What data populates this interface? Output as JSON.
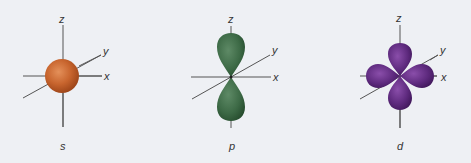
{
  "figure": {
    "background": "#eef0f4",
    "axis_color": "#555555",
    "orbitals": [
      {
        "name": "s",
        "label": "s",
        "shape": "sphere",
        "color": "#c8652e",
        "axes": {
          "z": "z",
          "y": "y",
          "x": "x"
        }
      },
      {
        "name": "p",
        "label": "p",
        "shape": "dumbbell",
        "color": "#3d6a46",
        "axes": {
          "z": "z",
          "y": "y",
          "x": "x"
        }
      },
      {
        "name": "d",
        "label": "d",
        "shape": "cloverleaf",
        "color": "#5e2a7e",
        "axes": {
          "z": "z",
          "y": "y",
          "x": "x"
        }
      }
    ]
  }
}
